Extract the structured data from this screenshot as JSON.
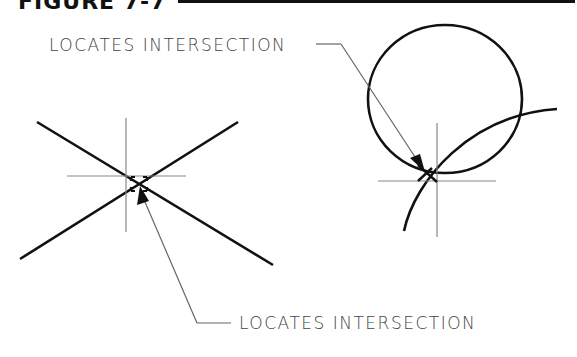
{
  "figure": {
    "title": "FIGURE 7-7"
  },
  "labels": {
    "top": "LOCATES INTERSECTION",
    "bottom": "LOCATES INTERSECTION"
  },
  "colors": {
    "geometry": "#111111",
    "construction": "#777777",
    "leader": "#666666",
    "text": "#444444"
  },
  "diagrams": [
    {
      "name": "intersecting-lines",
      "description": "two crossing lines with crosshair cursor and intersection marker"
    },
    {
      "name": "circle-arc-intersection",
      "description": "circle and arc intersection with crosshair cursor and intersection marker"
    }
  ]
}
